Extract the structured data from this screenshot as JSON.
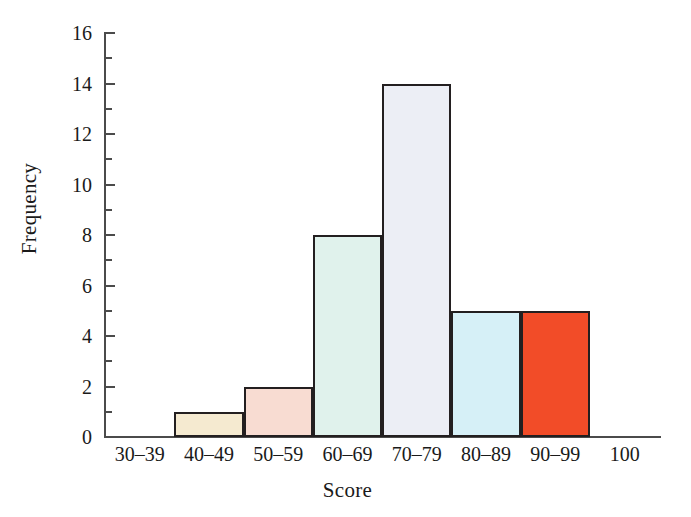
{
  "chart_data": {
    "type": "bar",
    "title": "",
    "subtitle": "",
    "xlabel": "Score",
    "ylabel": "Frequency",
    "categories": [
      "30–39",
      "40–49",
      "50–59",
      "60–69",
      "70–79",
      "80–89",
      "90–99"
    ],
    "values": [
      0,
      1,
      2,
      8,
      14,
      5,
      5
    ],
    "bar_colors": [
      "#ffffff",
      "#f5ead0",
      "#f8dcd2",
      "#e0f2ec",
      "#eceef5",
      "#d6f0f7",
      "#f24c28"
    ],
    "bar_edge_color": "#231f20",
    "axis_color": "#4b4b4b",
    "background": "#ffffff",
    "grid": false,
    "legend": null,
    "ylim": [
      0,
      16
    ],
    "ytick_labels": [
      "0",
      "2",
      "4",
      "6",
      "8",
      "10",
      "12",
      "14",
      "16"
    ],
    "ytick_values": [
      0,
      2,
      4,
      6,
      8,
      10,
      12,
      14,
      16
    ],
    "ytick_minor_values": [
      1,
      3,
      5,
      7,
      9,
      11,
      13,
      15
    ],
    "xtick_labels": [
      "30–39",
      "40–49",
      "50–59",
      "60–69",
      "70–79",
      "80–89",
      "90–99",
      "100"
    ],
    "x_extra_tick_label": "100"
  }
}
